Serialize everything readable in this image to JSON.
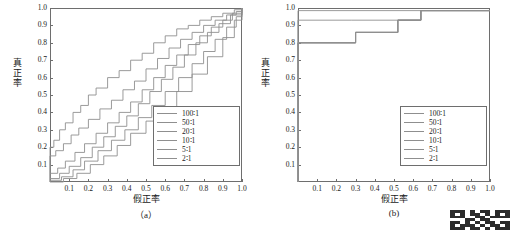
{
  "figure": {
    "panels": [
      {
        "caption": "（a）",
        "xlabel": "假正率",
        "ylabel": "真正率"
      },
      {
        "caption": "(b)",
        "xlabel": "假正率",
        "ylabel": "真正率"
      }
    ],
    "watermark_label": "watermark-qr"
  },
  "chart_data": [
    {
      "type": "line",
      "title": "",
      "subtitle": "（a）",
      "xlabel": "假正率",
      "ylabel": "真正率",
      "xlim": [
        0,
        1
      ],
      "ylim": [
        0,
        1
      ],
      "xticks": [
        0,
        0.1,
        0.2,
        0.3,
        0.4,
        0.5,
        0.6,
        0.7,
        0.8,
        0.9,
        1.0
      ],
      "xticklabels": [
        "0",
        "0.1",
        "0.2",
        "0.3",
        "0.4",
        "0.5",
        "0.6",
        "0.7",
        "0.8",
        "0.9",
        "1.0"
      ],
      "yticks": [
        0,
        0.1,
        0.2,
        0.3,
        0.4,
        0.5,
        0.6,
        0.7,
        0.8,
        0.9,
        1.0
      ],
      "yticklabels": [
        "0",
        "0.1",
        "0.2",
        "0.3",
        "0.4",
        "0.5",
        "0.6",
        "0.7",
        "0.8",
        "0.9",
        "1.0"
      ],
      "grid": false,
      "legend_position": "lower right",
      "legend": [
        "100∶1",
        "50∶1",
        "20∶1",
        "10∶1",
        "5∶1",
        "2∶1"
      ],
      "series": [
        {
          "name": "100∶1",
          "color": "#8f8f8f",
          "x": [
            0,
            0,
            0.02,
            0.05,
            0.08,
            0.12,
            0.16,
            0.2,
            0.24,
            0.3,
            0.36,
            0.42,
            0.48,
            0.54,
            0.6,
            0.66,
            0.72,
            0.78,
            0.84,
            0.9,
            0.96,
            1.0
          ],
          "y": [
            0,
            0.2,
            0.24,
            0.3,
            0.34,
            0.4,
            0.44,
            0.5,
            0.54,
            0.6,
            0.64,
            0.7,
            0.74,
            0.8,
            0.84,
            0.88,
            0.9,
            0.93,
            0.95,
            0.97,
            0.99,
            1.0
          ]
        },
        {
          "name": "50∶1",
          "color": "#8f8f8f",
          "x": [
            0,
            0,
            0.03,
            0.07,
            0.11,
            0.15,
            0.2,
            0.26,
            0.32,
            0.38,
            0.44,
            0.5,
            0.56,
            0.62,
            0.68,
            0.74,
            0.8,
            0.86,
            0.92,
            0.97,
            1.0
          ],
          "y": [
            0,
            0.15,
            0.18,
            0.22,
            0.27,
            0.31,
            0.36,
            0.42,
            0.47,
            0.53,
            0.58,
            0.65,
            0.71,
            0.77,
            0.82,
            0.86,
            0.9,
            0.93,
            0.96,
            0.98,
            1.0
          ]
        },
        {
          "name": "20∶1",
          "color": "#8f8f8f",
          "x": [
            0,
            0.04,
            0.08,
            0.13,
            0.18,
            0.24,
            0.3,
            0.36,
            0.42,
            0.48,
            0.54,
            0.6,
            0.66,
            0.72,
            0.78,
            0.84,
            0.9,
            0.95,
            1.0
          ],
          "y": [
            0.05,
            0.08,
            0.12,
            0.17,
            0.22,
            0.28,
            0.34,
            0.4,
            0.46,
            0.53,
            0.6,
            0.67,
            0.73,
            0.79,
            0.84,
            0.89,
            0.93,
            0.97,
            1.0
          ]
        },
        {
          "name": "10∶1",
          "color": "#8f8f8f",
          "x": [
            0,
            0.05,
            0.1,
            0.16,
            0.22,
            0.28,
            0.34,
            0.4,
            0.46,
            0.52,
            0.58,
            0.64,
            0.7,
            0.76,
            0.82,
            0.88,
            0.94,
            1.0
          ],
          "y": [
            0.02,
            0.05,
            0.09,
            0.14,
            0.2,
            0.26,
            0.32,
            0.38,
            0.45,
            0.52,
            0.59,
            0.66,
            0.73,
            0.8,
            0.86,
            0.91,
            0.96,
            1.0
          ]
        },
        {
          "name": "5∶1",
          "color": "#8f8f8f",
          "x": [
            0,
            0.06,
            0.12,
            0.18,
            0.25,
            0.32,
            0.39,
            0.46,
            0.53,
            0.6,
            0.67,
            0.74,
            0.8,
            0.86,
            0.92,
            0.97,
            1.0
          ],
          "y": [
            0.01,
            0.03,
            0.07,
            0.12,
            0.18,
            0.24,
            0.3,
            0.37,
            0.44,
            0.52,
            0.6,
            0.68,
            0.75,
            0.82,
            0.89,
            0.95,
            1.0
          ]
        },
        {
          "name": "2∶1",
          "color": "#8f8f8f",
          "x": [
            0,
            0.07,
            0.14,
            0.21,
            0.28,
            0.35,
            0.42,
            0.5,
            0.58,
            0.66,
            0.74,
            0.82,
            0.9,
            0.96,
            1.0
          ],
          "y": [
            0,
            0.02,
            0.05,
            0.1,
            0.15,
            0.21,
            0.28,
            0.35,
            0.43,
            0.52,
            0.62,
            0.72,
            0.83,
            0.93,
            1.0
          ]
        }
      ]
    },
    {
      "type": "line",
      "title": "",
      "subtitle": "(b)",
      "xlabel": "假正率",
      "ylabel": "真正率",
      "xlim": [
        0,
        1
      ],
      "ylim": [
        0,
        1
      ],
      "xticks": [
        0,
        0.1,
        0.2,
        0.3,
        0.4,
        0.5,
        0.6,
        0.7,
        0.8,
        0.9,
        1.0
      ],
      "xticklabels": [
        "0",
        "0.1",
        "0.2",
        "0.3",
        "0.4",
        "0.5",
        "0.6",
        "0.7",
        "0.8",
        "0.9",
        "1.0"
      ],
      "yticks": [
        0,
        0.1,
        0.2,
        0.3,
        0.4,
        0.5,
        0.6,
        0.7,
        0.8,
        0.9,
        1.0
      ],
      "yticklabels": [
        "0",
        "0.1",
        "0.2",
        "0.3",
        "0.4",
        "0.5",
        "0.6",
        "0.7",
        "0.8",
        "0.9",
        "1.0"
      ],
      "grid": false,
      "legend_position": "lower right",
      "legend": [
        "100∶1",
        "50∶1",
        "20∶1",
        "10∶1",
        "5∶1",
        "2∶1"
      ],
      "series": [
        {
          "name": "100∶1",
          "color": "#8f8f8f",
          "x": [
            0,
            0,
            1.0
          ],
          "y": [
            0,
            0.985,
            0.985
          ]
        },
        {
          "name": "50∶1",
          "color": "#8f8f8f",
          "x": [
            0,
            0,
            0.28,
            0.28,
            0.64,
            0.64,
            1.0
          ],
          "y": [
            0,
            0.93,
            0.93,
            0.93,
            0.93,
            0.985,
            0.985
          ]
        },
        {
          "name": "20∶1",
          "color": "#8f8f8f",
          "x": [
            0,
            0,
            0.3,
            0.3,
            0.52,
            0.52,
            0.64,
            0.64,
            1.0
          ],
          "y": [
            0,
            0.8,
            0.8,
            0.86,
            0.86,
            0.93,
            0.93,
            0.985,
            0.985
          ]
        },
        {
          "name": "10∶1",
          "color": "#8f8f8f",
          "x": [
            0,
            0,
            0.3,
            0.3,
            0.52,
            0.52,
            0.64,
            0.64,
            1.0
          ],
          "y": [
            0,
            0.8,
            0.8,
            0.86,
            0.86,
            0.93,
            0.93,
            0.985,
            0.985
          ]
        },
        {
          "name": "5∶1",
          "color": "#8f8f8f",
          "x": [
            0,
            0,
            0.3,
            0.3,
            0.52,
            0.52,
            0.64,
            0.64,
            1.0
          ],
          "y": [
            0,
            0.8,
            0.8,
            0.86,
            0.86,
            0.93,
            0.93,
            0.985,
            0.985
          ]
        },
        {
          "name": "2∶1",
          "color": "#8f8f8f",
          "x": [
            0,
            0,
            0.3,
            0.3,
            0.52,
            0.52,
            0.64,
            0.64,
            1.0
          ],
          "y": [
            0,
            0.8,
            0.8,
            0.86,
            0.86,
            0.93,
            0.93,
            0.985,
            0.985
          ]
        }
      ]
    }
  ]
}
